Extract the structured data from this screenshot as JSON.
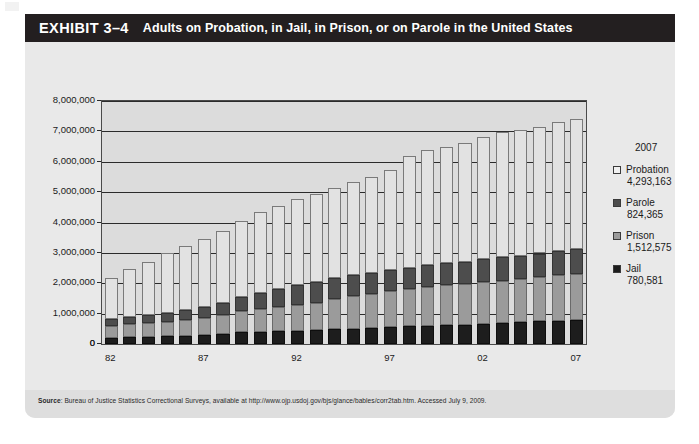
{
  "exhibit": {
    "number_label": "EXHIBIT 3–4",
    "title": "Adults on Probation, in Jail, in Prison, or on Parole in the United States"
  },
  "legend": {
    "year": "2007",
    "entries": [
      {
        "key": "probation",
        "label": "Probation",
        "value": "4,293,163",
        "swatch": "light-gray-swatch",
        "color": "#f0f0f0"
      },
      {
        "key": "parole",
        "label": "Parole",
        "value": "824,365",
        "swatch": "dark-gray-swatch",
        "color": "#4d4d4d"
      },
      {
        "key": "prison",
        "label": "Prison",
        "value": "1,512,575",
        "swatch": "medium-gray-swatch",
        "color": "#9b9b9b"
      },
      {
        "key": "jail",
        "label": "Jail",
        "value": "780,581",
        "swatch": "black-swatch",
        "color": "#1d1d1d"
      }
    ]
  },
  "source": {
    "prefix": "Source",
    "text": ": Bureau of Justice Statistics Correctional Surveys, available at http://www.ojp.usdoj.gov/bjs/glance/bables/corr2tab.htm. Accessed July 9, 2009."
  },
  "chart_data": {
    "type": "bar",
    "stacked": true,
    "title": "Adults on Probation, in Jail, in Prison, or on Parole in the United States",
    "xlabel": "",
    "ylabel": "",
    "ylim": [
      0,
      8000000
    ],
    "ytick_values": [
      0,
      1000000,
      2000000,
      3000000,
      4000000,
      5000000,
      6000000,
      7000000,
      8000000
    ],
    "ytick_labels": [
      "0",
      "1,000,000",
      "2,000,000",
      "3,000,000",
      "4,000,000",
      "5,000,000",
      "6,000,000",
      "7,000,000",
      "8,000,000"
    ],
    "grid": true,
    "legend_position": "right",
    "x": [
      1982,
      1983,
      1984,
      1985,
      1986,
      1987,
      1988,
      1989,
      1990,
      1991,
      1992,
      1993,
      1994,
      1995,
      1996,
      1997,
      1998,
      1999,
      2000,
      2001,
      2002,
      2003,
      2004,
      2005,
      2006,
      2007
    ],
    "categories": [
      "82",
      "83",
      "84",
      "85",
      "86",
      "87",
      "88",
      "89",
      "90",
      "91",
      "92",
      "93",
      "94",
      "95",
      "96",
      "97",
      "98",
      "99",
      "00",
      "01",
      "02",
      "03",
      "04",
      "05",
      "06",
      "07"
    ],
    "xtick_labels": [
      "82",
      "87",
      "92",
      "97",
      "02",
      "07"
    ],
    "xtick_indices": [
      0,
      5,
      10,
      15,
      20,
      25
    ],
    "stack_order_bottom_to_top": [
      "jail",
      "prison",
      "parole",
      "probation"
    ],
    "series": [
      {
        "name": "Jail",
        "color": "#1d1d1d",
        "values": [
          209582,
          223551,
          234500,
          256615,
          274444,
          295873,
          343569,
          395553,
          405320,
          426479,
          441781,
          455500,
          479800,
          507044,
          518492,
          567079,
          592462,
          605943,
          621149,
          631240,
          665475,
          691301,
          713990,
          747529,
          765819,
          780581
        ]
      },
      {
        "name": "Prison",
        "color": "#9b9b9b",
        "values": [
          395516,
          419820,
          443398,
          480568,
          522084,
          560812,
          603732,
          680907,
          743382,
          792535,
          850566,
          909381,
          990147,
          1078542,
          1127528,
          1176564,
          1224469,
          1287172,
          1316333,
          1330007,
          1367547,
          1390279,
          1421345,
          1448344,
          1492973,
          1512575
        ]
      },
      {
        "name": "Parole",
        "color": "#4d4d4d",
        "values": [
          224604,
          246440,
          266992,
          300203,
          325638,
          355505,
          407977,
          456803,
          531407,
          590442,
          658601,
          676100,
          690371,
          679421,
          679733,
          694787,
          696385,
          714457,
          723898,
          732333,
          750934,
          769925,
          771852,
          784408,
          798202,
          824365
        ]
      },
      {
        "name": "Probation",
        "color": "#f0f0f0",
        "values": [
          1335359,
          1582947,
          1740948,
          1968712,
          2114621,
          2247158,
          2356483,
          2522125,
          2670234,
          2728472,
          2811611,
          2903061,
          2981022,
          3077861,
          3164996,
          3296513,
          3670441,
          3779922,
          3826209,
          3931731,
          4024067,
          4120012,
          4151125,
          4162536,
          4236800,
          4293163
        ]
      }
    ],
    "totals": [
      2165061,
      2472758,
      2685838,
      3006098,
      3236787,
      3459348,
      3711761,
      4055388,
      4350343,
      4537928,
      4762559,
      4944042,
      5141340,
      5342868,
      5490749,
      5734943,
      6183757,
      6387494,
      6487589,
      6625311,
      6808023,
      6971517,
      7058312,
      7142817,
      7293794,
      7410684
    ]
  }
}
